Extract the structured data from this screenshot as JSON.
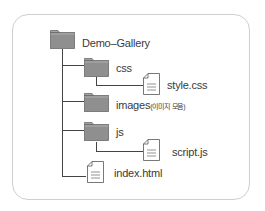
{
  "tree": {
    "root": {
      "label": "Demo–Gallery",
      "type": "folder"
    },
    "children": [
      {
        "label": "css",
        "type": "folder",
        "children": [
          {
            "label": "style.css",
            "type": "file"
          }
        ]
      },
      {
        "label": "images",
        "note": "(이미지 모음)",
        "type": "folder"
      },
      {
        "label": "js",
        "type": "folder",
        "children": [
          {
            "label": "script.js",
            "type": "file"
          }
        ]
      },
      {
        "label": "index.html",
        "type": "file"
      }
    ]
  },
  "colors": {
    "folder_fill": "#8f8f8f",
    "folder_stroke": "#6a6a6a",
    "line": "#444444",
    "frame": "#cfcfcf"
  }
}
